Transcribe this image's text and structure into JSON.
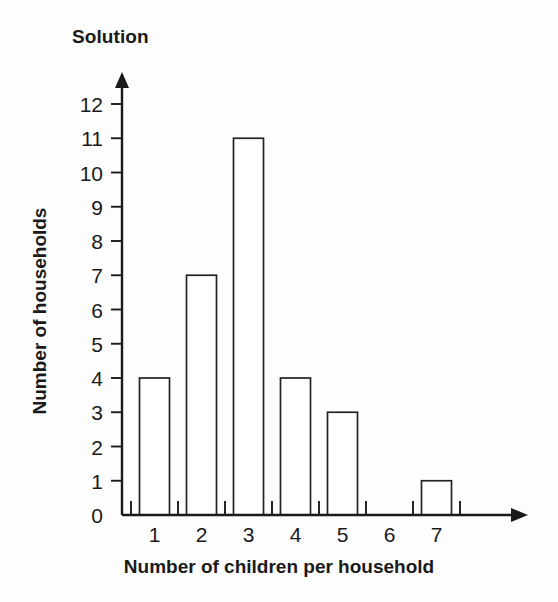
{
  "chart_data": {
    "type": "bar",
    "title": "Solution",
    "xlabel": "Number of children per household",
    "ylabel": "Number of households",
    "categories": [
      "1",
      "2",
      "3",
      "4",
      "5",
      "6",
      "7"
    ],
    "values": [
      4,
      7,
      11,
      4,
      3,
      0,
      1
    ],
    "ylim": [
      0,
      12
    ],
    "y_ticks": [
      "0",
      "1",
      "2",
      "3",
      "4",
      "5",
      "6",
      "7",
      "8",
      "9",
      "10",
      "11",
      "12"
    ],
    "grid": false,
    "legend": null,
    "bar_fill": "#ffffff",
    "bar_stroke": "#232323",
    "axis_color": "#1a1a1a",
    "background": "#fdfdfd",
    "bars": [
      {
        "category": "1",
        "value": 4
      },
      {
        "category": "2",
        "value": 7
      },
      {
        "category": "3",
        "value": 11
      },
      {
        "category": "4",
        "value": 4
      },
      {
        "category": "5",
        "value": 3
      },
      {
        "category": "6",
        "value": 0
      },
      {
        "category": "7",
        "value": 1
      }
    ]
  }
}
